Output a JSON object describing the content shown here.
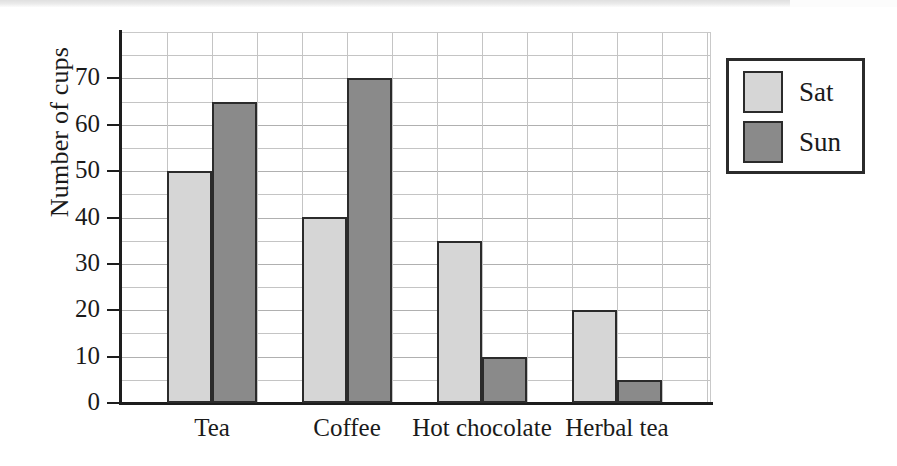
{
  "chart_data": {
    "type": "bar",
    "title": "",
    "subtitle": "",
    "xlabel": "",
    "ylabel": "Number of cups",
    "categories": [
      "Tea",
      "Coffee",
      "Hot chocolate",
      "Herbal tea"
    ],
    "series": [
      {
        "name": "Sat",
        "values": [
          50,
          40,
          35,
          20
        ],
        "color": "#d6d6d6"
      },
      {
        "name": "Sun",
        "values": [
          65,
          70,
          10,
          5
        ],
        "color": "#8a8a8a"
      }
    ],
    "ylim": [
      0,
      80
    ],
    "ytick_labels": [
      "0",
      "10",
      "20",
      "30",
      "40",
      "50",
      "60",
      "70"
    ],
    "ytick_values": [
      0,
      10,
      20,
      30,
      40,
      50,
      60,
      70
    ],
    "minor_tick_step": 5,
    "grid": true,
    "legend_position": "upper-right",
    "legend_entries": [
      "Sat",
      "Sun"
    ]
  },
  "axis": {
    "y_title": "Number of cups"
  },
  "legend": {
    "items": [
      {
        "label": "Sat"
      },
      {
        "label": "Sun"
      }
    ]
  }
}
